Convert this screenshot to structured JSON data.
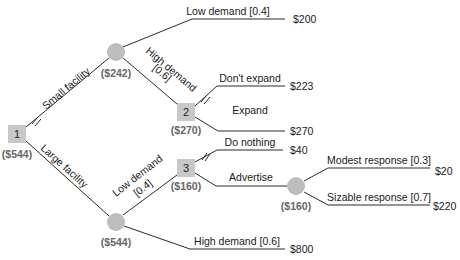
{
  "colors": {
    "decision_node": "#c8c8c8",
    "chance_node": "#bdbdbd",
    "line": "#2a2a2a",
    "value_text": "#666666"
  },
  "nodes": {
    "n1": {
      "type": "decision",
      "label": "1",
      "value": "($544)"
    },
    "chance_small": {
      "type": "chance",
      "value": "($242)"
    },
    "n2": {
      "type": "decision",
      "label": "2",
      "value": "($270)"
    },
    "chance_large": {
      "type": "chance",
      "value": "($544)"
    },
    "n3": {
      "type": "decision",
      "label": "3",
      "value": "($160)"
    },
    "chance_advertise": {
      "type": "chance",
      "value": "($160)"
    }
  },
  "branches": {
    "small_facility": {
      "label": "Small facility",
      "pruned": false
    },
    "large_facility": {
      "label": "Large facility",
      "pruned": true
    },
    "small_low": {
      "label": "Low demand [0.4]",
      "payoff": "$200"
    },
    "small_high": {
      "label_line1": "High demand",
      "label_line2": "[0.6]"
    },
    "dont_expand": {
      "label": "Don't expand",
      "payoff": "$223",
      "pruned": true
    },
    "expand": {
      "label": "Expand",
      "payoff": "$270"
    },
    "large_low": {
      "label_line1": "Low demand",
      "label_line2": "[0.4]"
    },
    "large_high": {
      "label": "High demand [0.6]",
      "payoff": "$800"
    },
    "do_nothing": {
      "label": "Do nothing",
      "payoff": "$40",
      "pruned": true
    },
    "advertise": {
      "label": "Advertise"
    },
    "modest": {
      "label": "Modest response [0.3]",
      "payoff": "$20"
    },
    "sizable": {
      "label": "Sizable response [0.7]",
      "payoff": "$220"
    }
  }
}
